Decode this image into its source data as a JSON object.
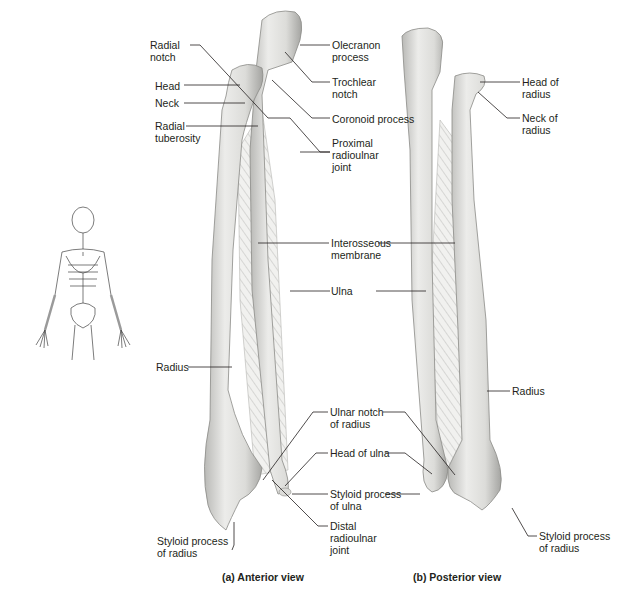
{
  "figure": {
    "colors": {
      "bone_fill": "#e6e6e3",
      "bone_shade": "#a9a9a6",
      "line": "#231f20",
      "text": "#231f20",
      "thumbnail_highlight": "#9a9a9a"
    },
    "anterior": {
      "caption": "(a) Anterior view",
      "labels": {
        "radial_notch": "Radial\nnotch",
        "head": "Head",
        "neck": "Neck",
        "radial_tuberosity": "Radial\ntuberosity",
        "olecranon_process": "Olecranon\nprocess",
        "trochlear_notch": "Trochlear\nnotch",
        "coronoid_process": "Coronoid process",
        "proximal_radioulnar_joint": "Proximal\nradioulnar\njoint",
        "interosseous_membrane": "Interosseous\nmembrane",
        "ulna": "Ulna",
        "radius": "Radius",
        "ulnar_notch_of_radius": "Ulnar notch\nof radius",
        "head_of_ulna": "Head of ulna",
        "styloid_process_of_ulna": "Styloid process\nof ulna",
        "distal_radioulnar_joint": "Distal\nradioulnar\njoint",
        "styloid_process_of_radius": "Styloid process\nof radius"
      }
    },
    "posterior": {
      "caption": "(b) Posterior view",
      "labels": {
        "head_of_radius": "Head of\nradius",
        "neck_of_radius": "Neck of\nradius",
        "radius": "Radius",
        "styloid_process_of_radius": "Styloid process\nof radius"
      }
    },
    "thumbnail": {
      "description": "Full skeleton orientation figure with forearms highlighted"
    }
  }
}
